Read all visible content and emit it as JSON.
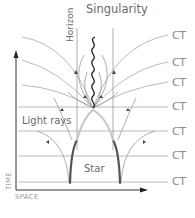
{
  "diagram": {
    "title": "Singularity",
    "labels": {
      "horizon": "Horizon",
      "light_rays": "Light rays",
      "star": "Star",
      "time_axis": "TIME",
      "space_axis": "SPACE"
    },
    "ct_labels": [
      "CT",
      "CT",
      "CT",
      "CT",
      "CT",
      "CT",
      "CT"
    ],
    "colors": {
      "lines": "#9a9a9a",
      "star_boundary_dark": "#555555",
      "star_boundary_light": "#c4c4c4",
      "singularity": "#222222",
      "text": "#6a6a6a"
    }
  }
}
